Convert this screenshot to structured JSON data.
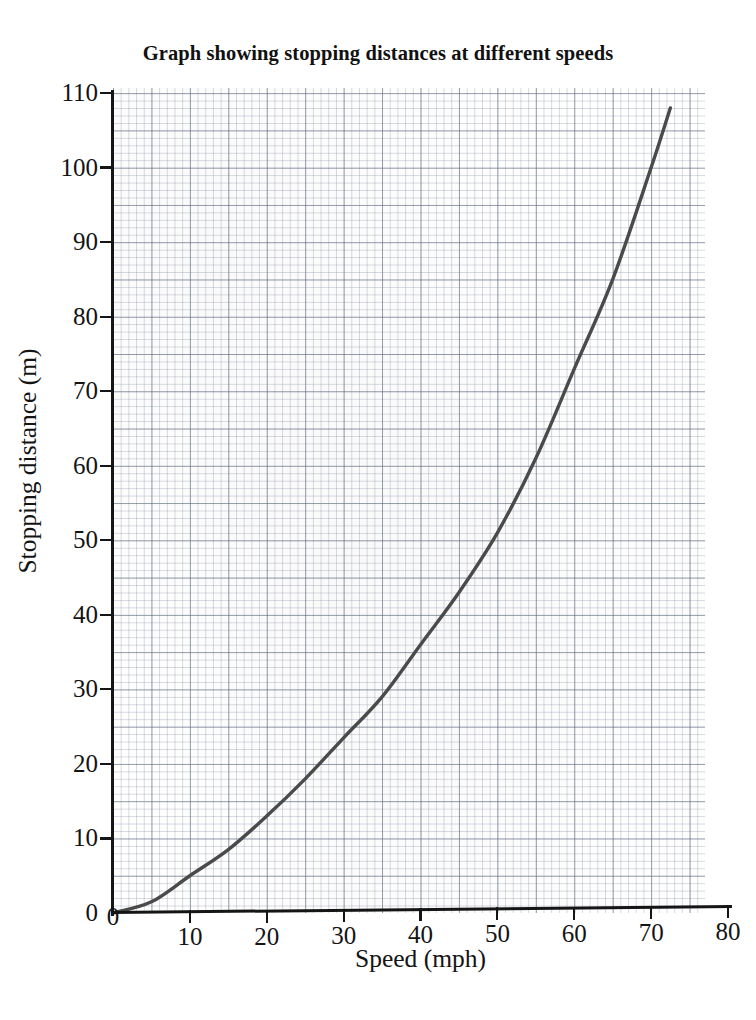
{
  "chart_data": {
    "type": "line",
    "title": "Graph showing stopping distances at different speeds",
    "xlabel": "Speed (mph)",
    "ylabel": "Stopping distance (m)",
    "xlim": [
      0,
      80
    ],
    "ylim": [
      0,
      110
    ],
    "xticks": [
      0,
      10,
      20,
      30,
      40,
      50,
      60,
      70,
      80
    ],
    "yticks": [
      0,
      10,
      20,
      30,
      40,
      50,
      60,
      70,
      80,
      90,
      100,
      110
    ],
    "grid": "graph-paper minor 1 unit, major 5 units",
    "legend": "none",
    "series": [
      {
        "name": "Stopping distance",
        "color": "#4a4a4a",
        "relationship": "approximately quadratic, d = 0.0206 * v^2",
        "x": [
          0,
          5,
          10,
          15,
          20,
          25,
          30,
          35,
          40,
          45,
          50,
          55,
          60,
          65,
          70,
          72.5
        ],
        "values": [
          0,
          1.5,
          5,
          8.5,
          13,
          18,
          23.5,
          29,
          36,
          43,
          51,
          61,
          73,
          85,
          100,
          108
        ]
      }
    ]
  },
  "axes": {
    "x_tick_labels": [
      "0",
      "10",
      "20",
      "30",
      "40",
      "50",
      "60",
      "70",
      "80"
    ],
    "y_tick_labels": [
      "0",
      "10",
      "20",
      "30",
      "40",
      "50",
      "60",
      "70",
      "80",
      "90",
      "100",
      "110"
    ],
    "x_title": "Speed (mph)",
    "y_title": "Stopping distance (m)"
  },
  "figure": {
    "title": "Graph showing stopping distances at different speeds",
    "curve_color": "#4a4a4a",
    "axis_color": "#151515",
    "grid_color": "#7882964d",
    "background": "#ffffff"
  }
}
